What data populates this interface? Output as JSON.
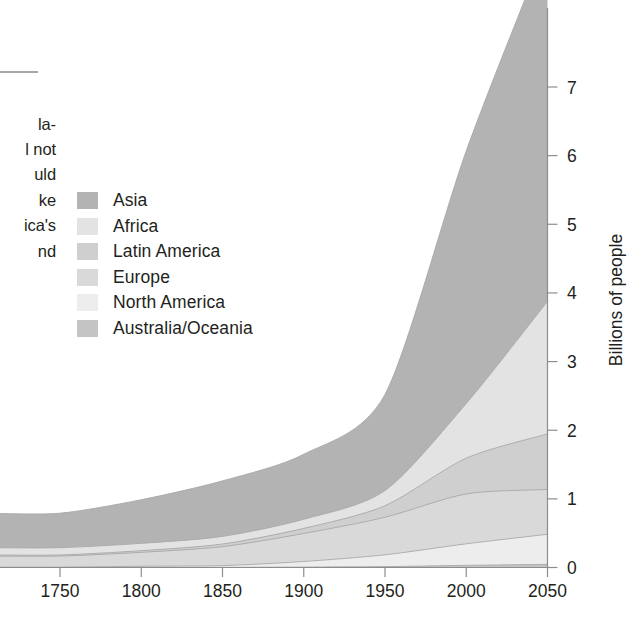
{
  "page": {
    "background": "#ffffff",
    "width": 642,
    "height": 629
  },
  "body_text": {
    "rule_visible": true,
    "fragments": [
      "la-",
      "l not",
      "uld",
      "ke",
      "ica's",
      "nd"
    ]
  },
  "legend": {
    "position": "inside-plot-upper-left",
    "items": [
      {
        "label": "Asia",
        "color": "#b3b3b3"
      },
      {
        "label": "Africa",
        "color": "#e3e3e3"
      },
      {
        "label": "Latin America",
        "color": "#cfcfcf"
      },
      {
        "label": "Europe",
        "color": "#d9d9d9"
      },
      {
        "label": "North America",
        "color": "#ededed"
      },
      {
        "label": "Australia/Oceania",
        "color": "#c4c4c4"
      }
    ]
  },
  "chart_data": {
    "type": "area",
    "stacked": true,
    "title": "",
    "subtitle": "",
    "xlabel": "",
    "ylabel": "Billions of people",
    "xlim": [
      1725,
      2050
    ],
    "ylim": [
      0,
      7.6
    ],
    "grid": false,
    "legend_position": "upper-left",
    "x": [
      1750,
      1800,
      1850,
      1900,
      1950,
      2000,
      2050
    ],
    "xticks": [
      "1750",
      "1800",
      "1850",
      "1900",
      "1950",
      "2000",
      "2050"
    ],
    "yticks": [
      "0",
      "1",
      "2",
      "3",
      "4",
      "5",
      "6",
      "7"
    ],
    "axis_side": "right",
    "series": [
      {
        "name": "Australia/Oceania",
        "color": "#c4c4c4",
        "values": [
          0.002,
          0.002,
          0.002,
          0.006,
          0.013,
          0.031,
          0.046
        ]
      },
      {
        "name": "North America",
        "color": "#ededed",
        "values": [
          0.002,
          0.016,
          0.026,
          0.082,
          0.172,
          0.314,
          0.438
        ]
      },
      {
        "name": "Europe",
        "color": "#d9d9d9",
        "values": [
          0.163,
          0.203,
          0.276,
          0.408,
          0.547,
          0.727,
          0.653
        ]
      },
      {
        "name": "Latin America",
        "color": "#cfcfcf",
        "values": [
          0.016,
          0.024,
          0.038,
          0.074,
          0.167,
          0.521,
          0.809
        ]
      },
      {
        "name": "Africa",
        "color": "#e3e3e3",
        "values": [
          0.106,
          0.107,
          0.111,
          0.133,
          0.221,
          0.796,
          1.932
        ]
      },
      {
        "name": "Asia",
        "color": "#b3b3b3",
        "values": [
          0.502,
          0.635,
          0.809,
          0.947,
          1.402,
          3.68,
          5.222
        ]
      }
    ],
    "stack_tops_2050": {
      "Australia/Oceania": 0.046,
      "North America": 0.484,
      "Europe": 1.137,
      "Latin America": 1.946,
      "Africa": 3.878,
      "Asia": 9.1
    }
  }
}
